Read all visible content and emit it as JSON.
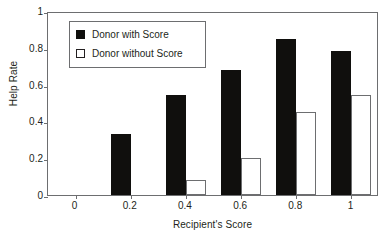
{
  "chart_data": {
    "type": "bar",
    "title": "",
    "xlabel": "Recipient's Score",
    "ylabel": "Help Rate",
    "categories": [
      "0",
      "0.2",
      "0.4",
      "0.6",
      "0.8",
      "1"
    ],
    "series": [
      {
        "name": "Donor with Score",
        "color": "#100f0d",
        "style": "filled",
        "values": [
          0,
          0.33,
          0.545,
          0.68,
          0.85,
          0.78
        ]
      },
      {
        "name": "Donor without Score",
        "color": "#ffffff",
        "style": "hollow",
        "values": [
          0,
          0,
          0.08,
          0.2,
          0.45,
          0.545
        ]
      }
    ],
    "xlim": [
      -0.1,
      1.1
    ],
    "ylim": [
      0,
      1
    ],
    "yticks": [
      "0",
      "0.2",
      "0.4",
      "0.6",
      "0.8",
      "1"
    ],
    "ytick_values": [
      0,
      0.2,
      0.4,
      0.6,
      0.8,
      1
    ],
    "xticks": [
      "0",
      "0.2",
      "0.4",
      "0.6",
      "0.8",
      "1"
    ],
    "xtick_values": [
      0,
      0.2,
      0.4,
      0.6,
      0.8,
      1
    ],
    "grid": false,
    "legend_position": "upper left inside",
    "frame": "full box"
  },
  "legend": {
    "entries": [
      {
        "label": "Donor with Score",
        "swatch": "filled-square-icon"
      },
      {
        "label": "Donor without Score",
        "swatch": "hollow-square-icon"
      }
    ]
  }
}
